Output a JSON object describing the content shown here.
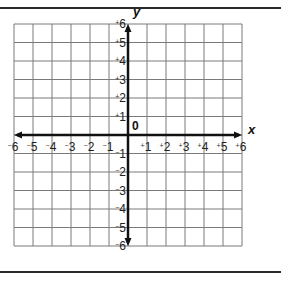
{
  "graph": {
    "x_axis_label": "x",
    "y_axis_label": "y",
    "origin_label": "0",
    "x_range": [
      -6,
      6
    ],
    "y_range": [
      -6,
      6
    ],
    "x_ticks": [
      "-6",
      "-5",
      "-4",
      "-3",
      "-2",
      "-1",
      "+1",
      "+2",
      "+3",
      "+4",
      "+5",
      "+6"
    ],
    "y_ticks": [
      "+6",
      "+5",
      "+4",
      "+3",
      "+2",
      "+1",
      "-1",
      "-2",
      "-3",
      "-4",
      "-5",
      "-6"
    ],
    "grid_color": "#7a7a7a",
    "axis_color": "#111111"
  }
}
